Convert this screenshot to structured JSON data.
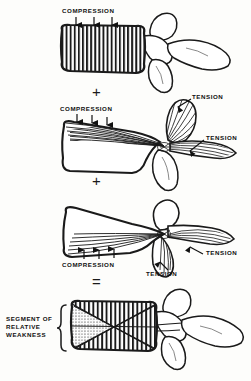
{
  "figure": {
    "background_color": "#fdfdfb",
    "ink_color": "#111111"
  },
  "operators": [
    {
      "name": "plus-sign-1",
      "symbol": "+",
      "x": 92,
      "y": 84
    },
    {
      "name": "plus-sign-2",
      "symbol": "+",
      "x": 92,
      "y": 173
    },
    {
      "name": "equals-sign",
      "symbol": "=",
      "x": 92,
      "y": 274
    }
  ],
  "panels": [
    {
      "id": "panel-axial-compression",
      "index": 1,
      "labels": [
        {
          "name": "compression-label",
          "text": "COMPRESSION",
          "x": 62,
          "y": 9
        }
      ],
      "arrows": [
        {
          "name": "compression-arrow",
          "direction": "down",
          "x": 76,
          "y": 18,
          "length": 9
        },
        {
          "name": "compression-arrow",
          "direction": "down",
          "x": 94,
          "y": 18,
          "length": 9
        },
        {
          "name": "compression-arrow",
          "direction": "down",
          "x": 112,
          "y": 18,
          "length": 9
        }
      ],
      "hatching": "vertical"
    },
    {
      "id": "panel-flexion-tension",
      "index": 2,
      "labels": [
        {
          "name": "compression-label",
          "text": "COMPRESSION",
          "x": 60,
          "y": 107
        },
        {
          "name": "tension-label-spinous",
          "text": "TENSION",
          "x": 193,
          "y": 96
        },
        {
          "name": "tension-label-posterior",
          "text": "TENSION",
          "x": 206,
          "y": 137
        }
      ],
      "arrows": [
        {
          "name": "compression-arrow",
          "direction": "down",
          "x": 77,
          "y": 114,
          "length": 8
        },
        {
          "name": "compression-arrow",
          "direction": "down",
          "x": 92,
          "y": 114,
          "length": 8
        },
        {
          "name": "compression-arrow",
          "direction": "down",
          "x": 107,
          "y": 114,
          "length": 8
        }
      ],
      "hatching": "fan"
    },
    {
      "id": "panel-extension-tension",
      "index": 3,
      "labels": [
        {
          "name": "compression-label",
          "text": "COMPRESSION",
          "x": 62,
          "y": 262
        },
        {
          "name": "tension-label-posterior",
          "text": "TENSION",
          "x": 205,
          "y": 251
        },
        {
          "name": "tension-label-inferior",
          "text": "TENSION",
          "x": 146,
          "y": 271
        }
      ],
      "arrows": [
        {
          "name": "compression-arrow",
          "direction": "up",
          "x": 84,
          "y": 243,
          "length": 9
        },
        {
          "name": "compression-arrow",
          "direction": "up",
          "x": 99,
          "y": 243,
          "length": 9
        },
        {
          "name": "compression-arrow",
          "direction": "up",
          "x": 114,
          "y": 243,
          "length": 9
        }
      ],
      "hatching": "fan"
    },
    {
      "id": "panel-segment-of-weakness",
      "index": 4,
      "labels": [
        {
          "name": "segment-of-relative-weakness-label",
          "text": "SEGMENT OF\nRELATIVE\nWEAKNESS",
          "x": 6,
          "y": 316
        }
      ],
      "arrows": [],
      "hatching": "cross",
      "brace": {
        "name": "curly-brace",
        "x": 64,
        "y": 306,
        "height": 46
      }
    }
  ]
}
